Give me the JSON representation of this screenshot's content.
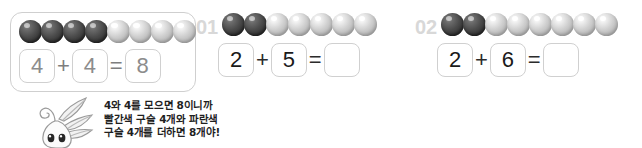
{
  "worksheet": {
    "example": {
      "label": "",
      "beads": {
        "dark": 4,
        "light": 4,
        "total": 8
      },
      "equation": {
        "addend1": "4",
        "operator": "+",
        "addend2": "4",
        "equals": "=",
        "sum": "8"
      }
    },
    "problems": [
      {
        "number": "01",
        "beads": {
          "dark": 2,
          "light": 5,
          "total": 7
        },
        "equation": {
          "addend1": "2",
          "operator": "+",
          "addend2": "5",
          "equals": "=",
          "sum": ""
        }
      },
      {
        "number": "02",
        "beads": {
          "dark": 2,
          "light": 6,
          "total": 8
        },
        "equation": {
          "addend1": "2",
          "operator": "+",
          "addend2": "6",
          "equals": "=",
          "sum": ""
        }
      }
    ],
    "explanation": {
      "line1": "4와 4를 모으면 8이니까",
      "line2": "빨간색 구슬 4개와 파란색",
      "line3": "구슬 4개를 더하면 8개야!"
    },
    "mascot": {
      "name": "sprout-character"
    },
    "colors": {
      "bead_dark": "#3a3a3a",
      "bead_light": "#c6c6c6",
      "box_border": "#d0d0d0",
      "problem_number": "#d8d8d8",
      "example_text": "#8c8c8c",
      "text": "#1f1f1f"
    }
  }
}
